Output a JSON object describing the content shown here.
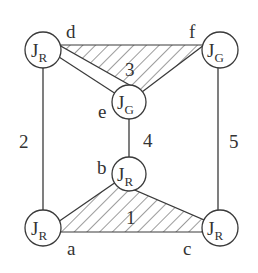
{
  "diagram": {
    "colors": {
      "stroke": "#3a3a3a",
      "fill": "#ffffff",
      "text": "#333333"
    },
    "nodes": [
      {
        "id": "d",
        "label": "d",
        "joint": "J",
        "sub": "R"
      },
      {
        "id": "f",
        "label": "f",
        "joint": "J",
        "sub": "G"
      },
      {
        "id": "e",
        "label": "e",
        "joint": "J",
        "sub": "G"
      },
      {
        "id": "b",
        "label": "b",
        "joint": "J",
        "sub": "R"
      },
      {
        "id": "a",
        "label": "a",
        "joint": "J",
        "sub": "R"
      },
      {
        "id": "c",
        "label": "c",
        "joint": "J",
        "sub": "R"
      }
    ],
    "links": [
      {
        "id": "1",
        "label": "1",
        "type": "hatched-triangle",
        "nodes": [
          "a",
          "b",
          "c"
        ]
      },
      {
        "id": "2",
        "label": "2",
        "type": "bar",
        "nodes": [
          "d",
          "a"
        ]
      },
      {
        "id": "3",
        "label": "3",
        "type": "hatched-triangle",
        "nodes": [
          "d",
          "f",
          "e"
        ]
      },
      {
        "id": "4",
        "label": "4",
        "type": "bar",
        "nodes": [
          "e",
          "b"
        ]
      },
      {
        "id": "5",
        "label": "5",
        "type": "bar",
        "nodes": [
          "f",
          "c"
        ]
      }
    ]
  }
}
